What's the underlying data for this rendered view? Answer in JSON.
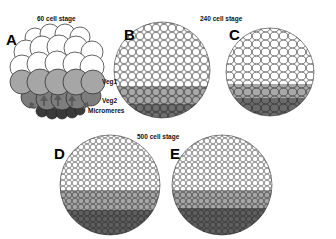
{
  "figure": {
    "stages": [
      {
        "title": "60 cell stage"
      },
      {
        "title": "240 cell stage"
      },
      {
        "title": "500 cell stage"
      }
    ],
    "panels": [
      {
        "letter": "A"
      },
      {
        "letter": "B"
      },
      {
        "letter": "C"
      },
      {
        "letter": "D"
      },
      {
        "letter": "E"
      }
    ],
    "tier_labels": {
      "veg1": "Veg1",
      "veg2": "Veg2",
      "micromeres": "Micromeres"
    },
    "colors": {
      "animal": "#ffffff",
      "veg1": "#a8a8a8",
      "veg2": "#7a7a7a",
      "micromeres": "#3a3a3a",
      "outline": "#222222"
    }
  }
}
